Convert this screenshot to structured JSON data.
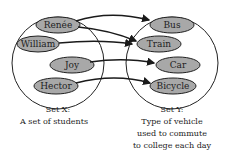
{
  "diagram": {
    "set_x": {
      "title": "Set X:",
      "subtitle": "A set of students",
      "elements": [
        "Renée",
        "William",
        "Joy",
        "Hector"
      ]
    },
    "set_y": {
      "title": "Set Y:",
      "subtitle_lines": [
        "Type of vehicle",
        "used to commute",
        "to college each day"
      ],
      "elements": [
        "Bus",
        "Train",
        "Car",
        "Bicycle"
      ]
    },
    "mappings": [
      {
        "from": "Renée",
        "to": "Bus"
      },
      {
        "from": "Renée",
        "to": "Train"
      },
      {
        "from": "William",
        "to": "Train"
      },
      {
        "from": "Joy",
        "to": "Car"
      },
      {
        "from": "Hector",
        "to": "Bicycle"
      }
    ],
    "colors": {
      "node_fill": "#a8a8a8",
      "stroke": "#1a1a1a"
    }
  }
}
